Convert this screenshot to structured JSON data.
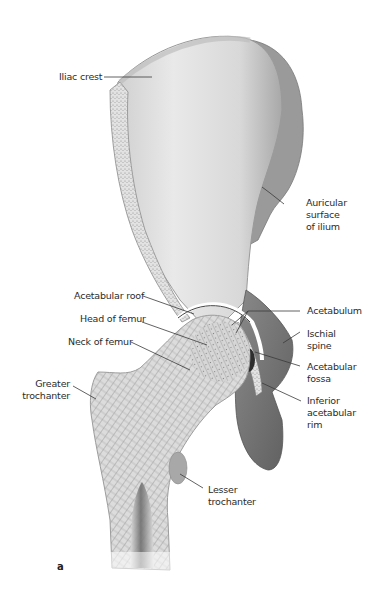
{
  "figure": {
    "panel_letter": "a",
    "labels": {
      "iliac_crest": "Iliac crest",
      "auricular_surface": [
        "Auricular",
        "surface",
        "of ilium"
      ],
      "acetabular_roof": "Acetabular roof",
      "head_of_femur": "Head of femur",
      "neck_of_femur": "Neck of femur",
      "greater_trochanter": [
        "Greater",
        "trochanter"
      ],
      "acetabulum": "Acetabulum",
      "ischial_spine": [
        "Ischial",
        "spine"
      ],
      "acetabular_fossa": [
        "Acetabular",
        "fossa"
      ],
      "inferior_acetabular_rim": [
        "Inferior",
        "acetabular",
        "rim"
      ],
      "lesser_trochanter": [
        "Lesser",
        "trochanter"
      ]
    },
    "colors": {
      "background": "#ffffff",
      "bone_light": "#e6e6e6",
      "bone_mid": "#b9b9b9",
      "bone_dark": "#6f6f6f",
      "leader_line": "#3a3a3a",
      "text": "#2b2b2b"
    }
  }
}
